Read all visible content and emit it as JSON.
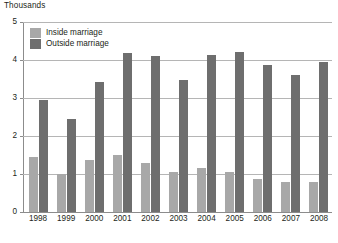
{
  "chart_data": {
    "type": "bar",
    "title": "",
    "unit_caption": "Thousands",
    "xlabel": "",
    "ylabel": "",
    "categories": [
      "1998",
      "1999",
      "2000",
      "2001",
      "2002",
      "2003",
      "2004",
      "2005",
      "2006",
      "2007",
      "2008"
    ],
    "series": [
      {
        "name": "Inside marriage",
        "color": "#a8a8a8",
        "values": [
          1.45,
          1.0,
          1.38,
          1.5,
          1.3,
          1.05,
          1.16,
          1.06,
          0.87,
          0.79,
          0.78
        ]
      },
      {
        "name": "Outside marriage",
        "color": "#6e6e6e",
        "values": [
          2.94,
          2.45,
          3.42,
          4.18,
          4.1,
          3.48,
          4.13,
          4.22,
          3.88,
          3.6,
          3.95
        ]
      }
    ],
    "ylim": [
      0,
      5
    ],
    "yticks": [
      "0",
      "1",
      "2",
      "3",
      "4",
      "5"
    ],
    "grid": true,
    "legend_position": "top-left"
  },
  "legend": {
    "items": [
      {
        "label": "Inside marriage"
      },
      {
        "label": "Outside marriage"
      }
    ]
  },
  "footnote": {
    "text": ""
  }
}
